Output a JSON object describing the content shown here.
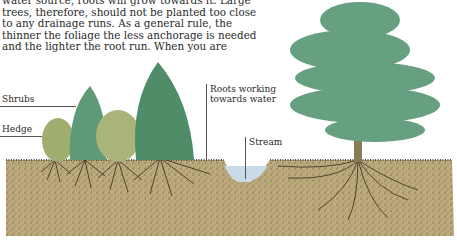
{
  "paragraph": {
    "lines": [
      "water source, roots will grow towards it. Large",
      "trees, therefore, should not be planted too close",
      "to any drainage runs. As a general rule, the",
      "thinner the foliage the less anchorage is needed",
      "and the lighter the root run. When you are"
    ]
  },
  "illustration": {
    "labels": {
      "shrubs": "Shrubs",
      "hedge": "Hedge",
      "roots_line1": "Roots working",
      "roots_line2": "towards water",
      "stream": "Stream"
    },
    "colors": {
      "soil": "#b9a67a",
      "soil_dark": "#6e5d3c",
      "foliage": "#5f9a78",
      "foliage_light": "#9fb27a",
      "water": "#c8dbe6",
      "trunk": "#8a7a55"
    }
  }
}
